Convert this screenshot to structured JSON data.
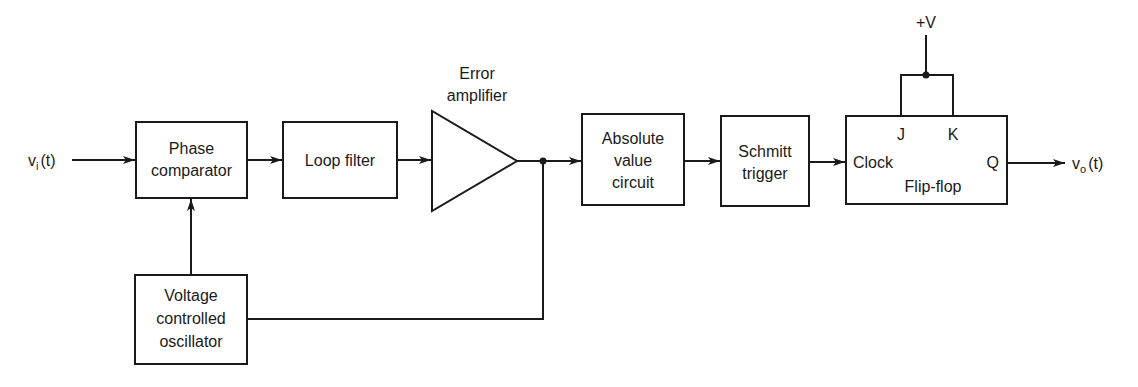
{
  "diagram": {
    "type": "block-diagram",
    "input": {
      "symbol": "v",
      "subscript": "i",
      "suffix": "(t)"
    },
    "output": {
      "symbol": "v",
      "subscript": "o",
      "suffix": "(t)"
    },
    "blocks": {
      "phase_comparator": {
        "line1": "Phase",
        "line2": "comparator"
      },
      "loop_filter": {
        "label": "Loop filter"
      },
      "error_amplifier": {
        "line1": "Error",
        "line2": "amplifier"
      },
      "absolute_value": {
        "line1": "Absolute",
        "line2": "value",
        "line3": "circuit"
      },
      "schmitt_trigger": {
        "line1": "Schmitt",
        "line2": "trigger"
      },
      "vco": {
        "line1": "Voltage",
        "line2": "controlled",
        "line3": "oscillator"
      },
      "flip_flop": {
        "label": "Flip-flop",
        "clock": "Clock",
        "j": "J",
        "k": "K",
        "q": "Q"
      }
    },
    "supply": {
      "label": "+V"
    },
    "colors": {
      "ink": "#1a1a1a",
      "background": "#ffffff"
    }
  }
}
